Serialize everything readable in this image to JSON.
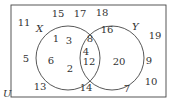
{
  "diagram": {
    "type": "venn",
    "universe_label": "U",
    "sets": [
      {
        "label": "X",
        "only": [
          "1",
          "3",
          "6",
          "2"
        ]
      },
      {
        "label": "Y",
        "only": [
          "16",
          "20"
        ]
      }
    ],
    "intersection": [
      "8",
      "4",
      "12"
    ],
    "outside": [
      "11",
      "15",
      "17",
      "18",
      "19",
      "5",
      "9",
      "10",
      "13",
      "14",
      "7"
    ],
    "elements": [
      {
        "v": "15",
        "x": 58,
        "y": 17
      },
      {
        "v": "17",
        "x": 80,
        "y": 17
      },
      {
        "v": "18",
        "x": 102,
        "y": 16
      },
      {
        "v": "11",
        "x": 24,
        "y": 26
      },
      {
        "v": "19",
        "x": 155,
        "y": 39
      },
      {
        "v": "16",
        "x": 107,
        "y": 33
      },
      {
        "v": "1",
        "x": 56,
        "y": 42
      },
      {
        "v": "3",
        "x": 69,
        "y": 44
      },
      {
        "v": "8",
        "x": 90,
        "y": 42
      },
      {
        "v": "4",
        "x": 86,
        "y": 55
      },
      {
        "v": "5",
        "x": 26,
        "y": 62
      },
      {
        "v": "6",
        "x": 51,
        "y": 64
      },
      {
        "v": "12",
        "x": 89,
        "y": 65
      },
      {
        "v": "20",
        "x": 119,
        "y": 65
      },
      {
        "v": "9",
        "x": 149,
        "y": 64
      },
      {
        "v": "2",
        "x": 70,
        "y": 72
      },
      {
        "v": "10",
        "x": 151,
        "y": 85
      },
      {
        "v": "13",
        "x": 40,
        "y": 90
      },
      {
        "v": "14",
        "x": 86,
        "y": 91
      },
      {
        "v": "7",
        "x": 127,
        "y": 92
      }
    ]
  }
}
